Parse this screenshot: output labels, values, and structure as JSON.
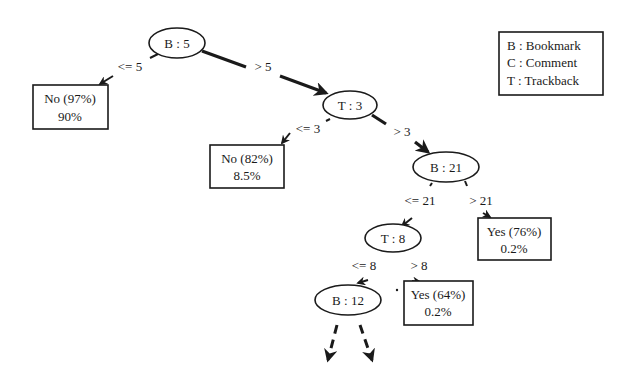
{
  "legend": {
    "items": [
      {
        "label": "B : Bookmark"
      },
      {
        "label": "C : Comment"
      },
      {
        "label": "T : Trackback"
      }
    ]
  },
  "nodes": {
    "root": {
      "label": "B : 5"
    },
    "t3": {
      "label": "T : 3"
    },
    "b21": {
      "label": "B : 21"
    },
    "t8": {
      "label": "T : 8"
    },
    "b12": {
      "label": "B : 12"
    }
  },
  "leaves": {
    "no97": {
      "line1": "No (97%)",
      "line2": "90%"
    },
    "no82": {
      "line1": "No (82%)",
      "line2": "8.5%"
    },
    "yes76": {
      "line1": "Yes (76%)",
      "line2": "0.2%"
    },
    "yes64": {
      "line1": "Yes (64%)",
      "line2": "0.2%"
    }
  },
  "edges": {
    "root_le": "<= 5",
    "root_gt": "> 5",
    "t3_le": "<= 3",
    "t3_gt": "> 3",
    "b21_le": "<= 21",
    "b21_gt": "> 21",
    "t8_le": "<= 8",
    "t8_gt": "> 8"
  },
  "colors": {
    "ink": "#1a1a1a",
    "background": "#ffffff"
  }
}
